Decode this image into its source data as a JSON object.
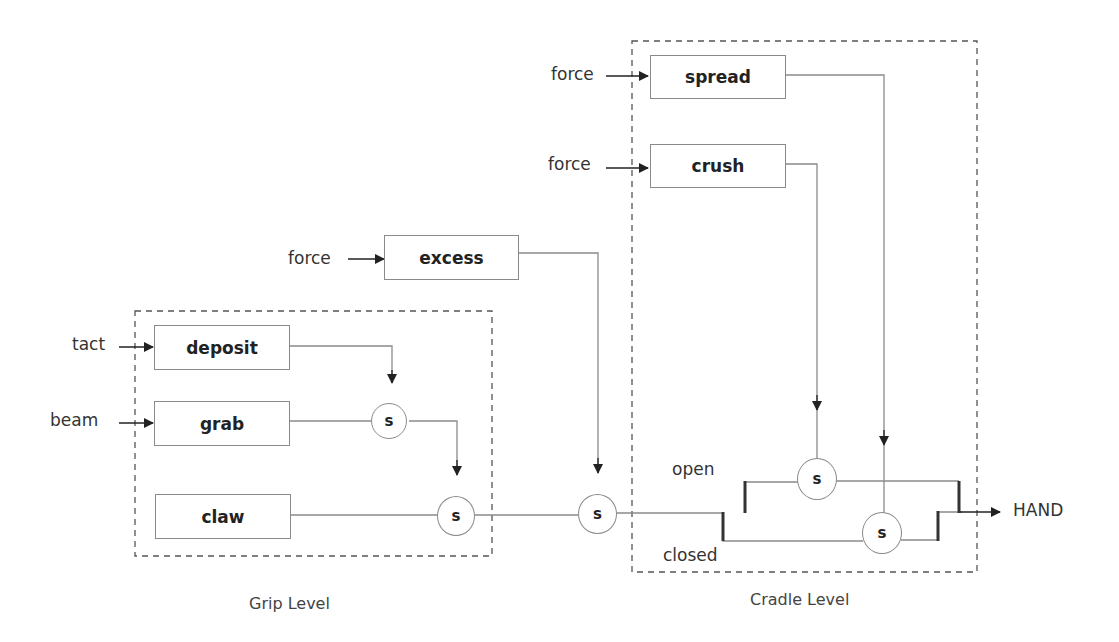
{
  "diagram": {
    "groups": {
      "grip": {
        "label": "Grip Level"
      },
      "cradle": {
        "label": "Cradle Level"
      }
    },
    "modules": {
      "spread": "spread",
      "crush": "crush",
      "excess": "excess",
      "deposit": "deposit",
      "grab": "grab",
      "claw": "claw"
    },
    "inputs": {
      "spread_in": "force",
      "crush_in": "force",
      "excess_in": "force",
      "deposit_in": "tact",
      "grab_in": "beam"
    },
    "suppressor_label": "s",
    "branch_labels": {
      "open": "open",
      "closed": "closed"
    },
    "output": "HAND",
    "colors": {
      "line": "#8a8a8a",
      "arrow": "#222222",
      "dash": "#555555"
    }
  }
}
